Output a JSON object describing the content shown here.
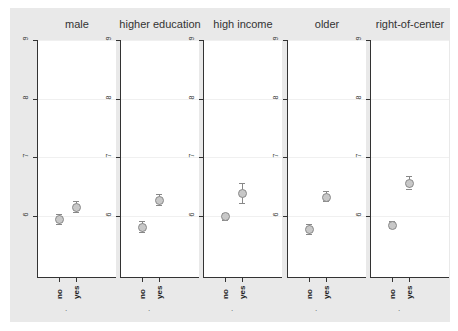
{
  "chart_data": {
    "type": "scatter",
    "subtype": "dot plot with confidence intervals, small multiples",
    "ylim": [
      5,
      9.2
    ],
    "yticks": [
      6,
      7,
      8,
      9
    ],
    "x_categories": [
      "no",
      "yes"
    ],
    "xlabel": ".",
    "grid": true,
    "panels": [
      {
        "title": "male",
        "points": [
          {
            "x": "no",
            "y": 5.95,
            "lo": 5.87,
            "hi": 6.03
          },
          {
            "x": "yes",
            "y": 6.15,
            "lo": 6.07,
            "hi": 6.25
          }
        ]
      },
      {
        "title": "higher education",
        "points": [
          {
            "x": "no",
            "y": 5.82,
            "lo": 5.73,
            "hi": 5.91
          },
          {
            "x": "yes",
            "y": 6.28,
            "lo": 6.19,
            "hi": 6.38
          }
        ]
      },
      {
        "title": "high income",
        "points": [
          {
            "x": "no",
            "y": 6.0,
            "lo": 5.94,
            "hi": 6.06
          },
          {
            "x": "yes",
            "y": 6.4,
            "lo": 6.23,
            "hi": 6.57
          }
        ]
      },
      {
        "title": "older",
        "points": [
          {
            "x": "no",
            "y": 5.78,
            "lo": 5.7,
            "hi": 5.86
          },
          {
            "x": "yes",
            "y": 6.33,
            "lo": 6.25,
            "hi": 6.42
          }
        ]
      },
      {
        "title": "right-of-center",
        "points": [
          {
            "x": "no",
            "y": 5.85,
            "lo": 5.79,
            "hi": 5.91
          },
          {
            "x": "yes",
            "y": 6.57,
            "lo": 6.47,
            "hi": 6.68
          }
        ]
      }
    ]
  }
}
